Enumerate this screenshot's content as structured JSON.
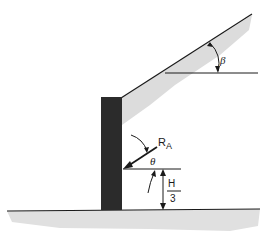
{
  "diagram": {
    "labels": {
      "resultant": "R",
      "resultant_sub": "A",
      "theta": "θ",
      "beta": "β",
      "height_num": "H",
      "height_den": "3"
    },
    "colors": {
      "wall": "#2b2b2b",
      "line": "#1a1a1a",
      "shade": "#d9d9d9",
      "ground_shade": "#dedede"
    }
  }
}
